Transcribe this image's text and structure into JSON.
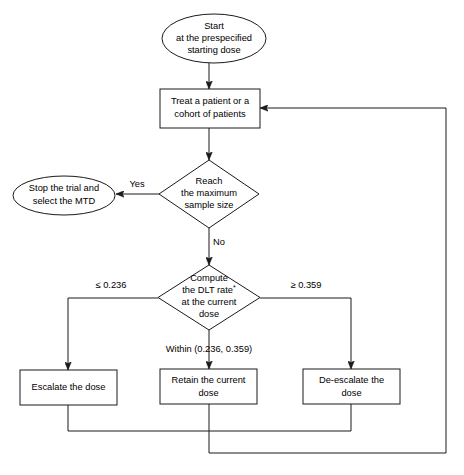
{
  "diagram": {
    "background_color": "#ffffff",
    "line_color": "#1a1a1a",
    "text_color": "#000000"
  },
  "nodes": {
    "start": {
      "shape": "oval",
      "line1": "Start",
      "line2": "at the prespecified",
      "line3": "starting dose"
    },
    "treat": {
      "shape": "rectangle",
      "line1": "Treat a patient or a",
      "line2": "cohort of patients"
    },
    "decision_sample_size": {
      "shape": "diamond",
      "line1": "Reach",
      "line2": "the maximum",
      "line3": "sample size"
    },
    "stop_trial": {
      "shape": "oval",
      "line1": "Stop the trial and",
      "line2": "select the MTD"
    },
    "decision_dlt": {
      "shape": "diamond",
      "line1": "Compute",
      "line2": "the DLT rate",
      "line2_superscript": "*",
      "line3": "at the current",
      "line4": "dose"
    },
    "escalate": {
      "shape": "rectangle",
      "line1": "Escalate the dose"
    },
    "retain": {
      "shape": "rectangle",
      "line1": "Retain the current",
      "line2": "dose"
    },
    "deescalate": {
      "shape": "rectangle",
      "line1": "De-escalate the",
      "line2": "dose"
    }
  },
  "edge_labels": {
    "yes": "Yes",
    "no": "No",
    "lower_threshold": "≤ 0.236",
    "upper_threshold": "≥ 0.359",
    "within_range": "Within (0.236, 0.359)"
  }
}
